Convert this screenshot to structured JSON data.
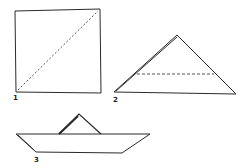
{
  "diagram": {
    "steps": [
      {
        "label": "1",
        "description": "Square sheet with diagonal dashed fold line"
      },
      {
        "label": "2",
        "description": "Folded triangle with horizontal dashed fold line"
      },
      {
        "label": "3",
        "description": "Finished paper boat"
      }
    ]
  },
  "colors": {
    "line": "#2a2a2a",
    "background": "#ffffff"
  }
}
